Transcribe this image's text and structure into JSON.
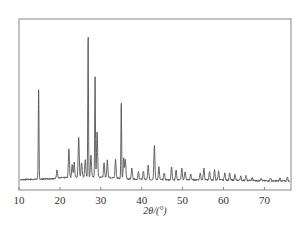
{
  "chart_data": {
    "type": "line",
    "title": "",
    "xlabel": "2θ/(°)",
    "ylabel": "",
    "xlim": [
      10,
      76.5
    ],
    "ylim": [
      0,
      100
    ],
    "grid": false,
    "legend": null,
    "x_ticks": [
      10,
      20,
      30,
      40,
      50,
      60,
      70
    ],
    "x_tick_labels": [
      "10",
      "20",
      "30",
      "40",
      "50",
      "60",
      "70"
    ],
    "y_ticks": [],
    "series": [
      {
        "name": "XRD pattern",
        "color": "#555555",
        "peaks": [
          {
            "x": 14.8,
            "y": 62
          },
          {
            "x": 19.3,
            "y": 6
          },
          {
            "x": 22.2,
            "y": 20
          },
          {
            "x": 23.0,
            "y": 9
          },
          {
            "x": 23.5,
            "y": 10
          },
          {
            "x": 24.6,
            "y": 28
          },
          {
            "x": 25.3,
            "y": 10
          },
          {
            "x": 26.2,
            "y": 12
          },
          {
            "x": 26.9,
            "y": 100
          },
          {
            "x": 27.6,
            "y": 15
          },
          {
            "x": 28.6,
            "y": 70
          },
          {
            "x": 29.1,
            "y": 32
          },
          {
            "x": 30.8,
            "y": 10
          },
          {
            "x": 31.6,
            "y": 12
          },
          {
            "x": 33.6,
            "y": 13
          },
          {
            "x": 35.0,
            "y": 54
          },
          {
            "x": 35.6,
            "y": 14
          },
          {
            "x": 36.0,
            "y": 13
          },
          {
            "x": 37.6,
            "y": 8
          },
          {
            "x": 39.2,
            "y": 5
          },
          {
            "x": 40.4,
            "y": 6
          },
          {
            "x": 41.6,
            "y": 10
          },
          {
            "x": 43.1,
            "y": 24
          },
          {
            "x": 44.2,
            "y": 9
          },
          {
            "x": 45.5,
            "y": 5
          },
          {
            "x": 47.3,
            "y": 9
          },
          {
            "x": 48.4,
            "y": 7
          },
          {
            "x": 49.8,
            "y": 8
          },
          {
            "x": 50.6,
            "y": 6
          },
          {
            "x": 52.0,
            "y": 4
          },
          {
            "x": 54.3,
            "y": 5
          },
          {
            "x": 55.2,
            "y": 8
          },
          {
            "x": 56.6,
            "y": 6
          },
          {
            "x": 57.8,
            "y": 7
          },
          {
            "x": 58.8,
            "y": 6
          },
          {
            "x": 60.3,
            "y": 5
          },
          {
            "x": 61.5,
            "y": 5
          },
          {
            "x": 62.8,
            "y": 4
          },
          {
            "x": 64.2,
            "y": 3
          },
          {
            "x": 65.5,
            "y": 3
          },
          {
            "x": 67.0,
            "y": 2
          },
          {
            "x": 69.2,
            "y": 2
          },
          {
            "x": 71.5,
            "y": 2
          },
          {
            "x": 73.8,
            "y": 2
          },
          {
            "x": 75.6,
            "y": 3
          }
        ]
      }
    ]
  },
  "colors": {
    "frame": "#888888",
    "line": "#555555",
    "text": "#333333"
  }
}
